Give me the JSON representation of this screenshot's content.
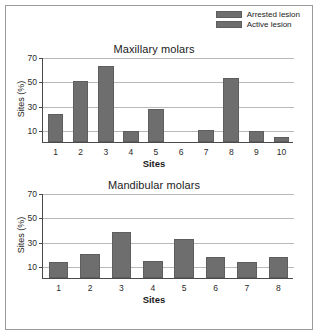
{
  "figure": {
    "background": "#ffffff",
    "border_color": "#9a9a9a",
    "bar_color": "#6e6e6e",
    "grid_color": "#b9b9b9",
    "axis_color": "#4a4a4a"
  },
  "legend": {
    "items": [
      {
        "label": "Arrested lesion",
        "color": "#6e6e6e"
      },
      {
        "label": "Active lesion",
        "color": "#6e6e6e"
      }
    ]
  },
  "chart_data": [
    {
      "type": "bar",
      "title": "Maxillary molars",
      "xlabel": "Sites",
      "ylabel": "Sites (%)",
      "categories": [
        "1",
        "2",
        "3",
        "4",
        "5",
        "6",
        "7",
        "8",
        "9",
        "10"
      ],
      "values": [
        23,
        50,
        63,
        9,
        27,
        0,
        10,
        53,
        9,
        4
      ],
      "series": [
        {
          "name": "Arrested lesion",
          "values": [
            23,
            50,
            63,
            9,
            27,
            0,
            10,
            53,
            9,
            4
          ]
        }
      ],
      "ylim": [
        0,
        70
      ],
      "yticks": [
        10,
        30,
        50,
        70
      ],
      "grid": true,
      "legend_position": "top-right"
    },
    {
      "type": "bar",
      "title": "Mandibular molars",
      "xlabel": "Sites",
      "ylabel": "Sites (%)",
      "categories": [
        "1",
        "2",
        "3",
        "4",
        "5",
        "6",
        "7",
        "8"
      ],
      "values": [
        13,
        20,
        38,
        14,
        32,
        17,
        13,
        17
      ],
      "series": [
        {
          "name": "Arrested lesion",
          "values": [
            13,
            20,
            38,
            14,
            32,
            17,
            13,
            17
          ]
        }
      ],
      "ylim": [
        0,
        70
      ],
      "yticks": [
        10,
        30,
        50,
        70
      ],
      "grid": true,
      "legend_position": "none"
    }
  ]
}
